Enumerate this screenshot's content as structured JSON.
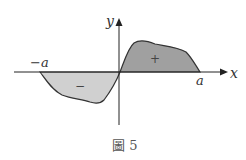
{
  "figure": {
    "caption": "圖 5",
    "axes": {
      "x_label": "x",
      "y_label": "y"
    },
    "ticks": {
      "neg_a": "−a",
      "pos_a": "a"
    },
    "regions": {
      "positive": {
        "sign": "+",
        "fill": "#a0a0a0"
      },
      "negative": {
        "sign": "−",
        "fill": "#d0d0d0"
      }
    },
    "colors": {
      "axis": "#222222",
      "curve": "#333333"
    }
  }
}
